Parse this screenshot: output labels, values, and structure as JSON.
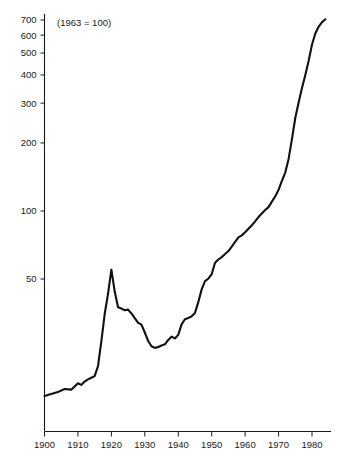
{
  "chart_data": {
    "type": "line",
    "title": "",
    "subtitle": "",
    "annotation": "(1963 = 100)",
    "xlabel": "",
    "ylabel": "",
    "yscale": "log",
    "xlim": [
      1900,
      1985
    ],
    "ylim": [
      13,
      780
    ],
    "grid": false,
    "legend": null,
    "y_ticks": [
      50,
      100,
      200,
      300,
      400,
      500,
      600,
      700
    ],
    "y_tick_labels": [
      "50",
      "100",
      "200",
      "300",
      "400",
      "500",
      "600",
      "700"
    ],
    "x_ticks": [
      1900,
      1910,
      1920,
      1930,
      1940,
      1950,
      1960,
      1970,
      1980
    ],
    "x_tick_labels": [
      "1900",
      "1910",
      "1920",
      "1930",
      "1940",
      "1950",
      "1960",
      "1970",
      "1980"
    ],
    "line_color": "#111111",
    "series": [
      {
        "name": "index",
        "x": [
          1900,
          1902,
          1904,
          1906,
          1908,
          1910,
          1911,
          1912,
          1913,
          1914,
          1915,
          1916,
          1917,
          1918,
          1919,
          1920,
          1921,
          1922,
          1923,
          1924,
          1925,
          1926,
          1927,
          1928,
          1929,
          1930,
          1931,
          1932,
          1933,
          1934,
          1935,
          1936,
          1937,
          1938,
          1939,
          1940,
          1941,
          1942,
          1943,
          1944,
          1945,
          1946,
          1947,
          1948,
          1949,
          1950,
          1951,
          1952,
          1953,
          1954,
          1955,
          1956,
          1957,
          1958,
          1959,
          1960,
          1961,
          1962,
          1963,
          1964,
          1965,
          1966,
          1967,
          1968,
          1969,
          1970,
          1971,
          1972,
          1973,
          1974,
          1975,
          1976,
          1977,
          1978,
          1979,
          1980,
          1981,
          1982,
          1983,
          1984
        ],
        "values": [
          15.2,
          15.5,
          15.8,
          16.3,
          16.2,
          17.3,
          17.0,
          17.6,
          18.0,
          18.3,
          18.6,
          20.6,
          26.5,
          35.0,
          43.0,
          55.0,
          44.0,
          37.5,
          37.0,
          36.4,
          36.6,
          35.2,
          33.6,
          32.0,
          31.4,
          29.0,
          26.6,
          25.2,
          24.8,
          25.0,
          25.4,
          25.7,
          26.9,
          27.8,
          27.3,
          28.3,
          31.5,
          33.2,
          33.6,
          34.2,
          35.4,
          39.5,
          45.0,
          49.0,
          50.2,
          52.5,
          59.0,
          61.0,
          62.5,
          64.5,
          66.5,
          69.5,
          73.0,
          76.5,
          78.0,
          80.5,
          83.5,
          86.5,
          90.0,
          94.0,
          97.5,
          101.0,
          104.0,
          110.0,
          116.0,
          124.0,
          136.0,
          148.0,
          170.0,
          208.0,
          258.0,
          302.0,
          350.0,
          400.0,
          462.0,
          545.0,
          610.0,
          655.0,
          685.0,
          705.0
        ]
      }
    ]
  },
  "axes": {
    "y_axis_name": "value-axis",
    "x_axis_name": "year-axis"
  }
}
